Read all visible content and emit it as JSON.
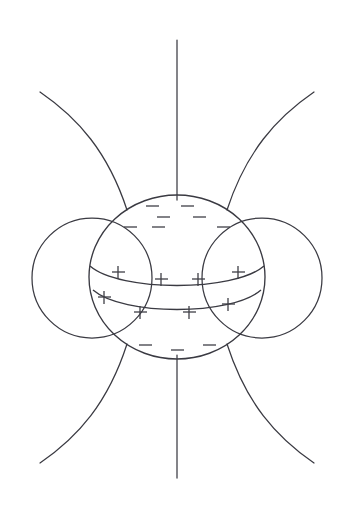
{
  "figure": {
    "background_color": "#ffffff",
    "line_color": "#3a3a42",
    "charge_color": "#3f3f46",
    "canvas": {
      "width": 354,
      "height": 517
    }
  },
  "sphere": {
    "name": "central-sphere",
    "center_x": 177,
    "center_y": 277,
    "radius_x": 88,
    "radius_y": 82,
    "top_y": 195,
    "bottom_y": 359,
    "left_x": 89,
    "right_x": 265
  },
  "equatorial_band": {
    "name": "positive-charge-band",
    "upper_curve_y": 268,
    "lower_curve_y": 292,
    "curve_sag": 24,
    "polarity": "positive"
  },
  "lobes": [
    {
      "name": "left-lobe",
      "center_x": 92,
      "center_y": 278,
      "radius": 60,
      "side": "left"
    },
    {
      "name": "right-lobe",
      "center_x": 262,
      "center_y": 278,
      "radius": 60,
      "side": "right"
    }
  ],
  "field_lines": {
    "vertical_top": {
      "name": "field-line-vertical-top",
      "x": 177,
      "y_start": 40,
      "y_end": 195
    },
    "vertical_bottom": {
      "name": "field-line-vertical-bottom",
      "x": 177,
      "y_start": 359,
      "y_end": 478
    },
    "diagonals": [
      {
        "name": "field-line-top-left",
        "quadrant": "top-left",
        "outer_x": 40,
        "outer_y": 92,
        "anchor_x": 127,
        "anchor_y": 210
      },
      {
        "name": "field-line-top-right",
        "quadrant": "top-right",
        "outer_x": 314,
        "outer_y": 92,
        "anchor_x": 227,
        "anchor_y": 210
      },
      {
        "name": "field-line-bottom-left",
        "quadrant": "bottom-left",
        "outer_x": 40,
        "outer_y": 463,
        "anchor_x": 127,
        "anchor_y": 344
      },
      {
        "name": "field-line-bottom-right",
        "quadrant": "bottom-right",
        "outer_x": 314,
        "outer_y": 463,
        "anchor_x": 227,
        "anchor_y": 344
      }
    ]
  },
  "charges": {
    "top_minus": {
      "symbol": "minus",
      "count": 7,
      "positions": [
        {
          "x": 152,
          "y": 206
        },
        {
          "x": 187,
          "y": 206
        },
        {
          "x": 163,
          "y": 217
        },
        {
          "x": 199,
          "y": 217
        },
        {
          "x": 130,
          "y": 227
        },
        {
          "x": 158,
          "y": 227
        },
        {
          "x": 223,
          "y": 227
        }
      ]
    },
    "band_plus": {
      "symbol": "plus",
      "count": 8,
      "positions": [
        {
          "x": 118,
          "y": 272
        },
        {
          "x": 161,
          "y": 279
        },
        {
          "x": 198,
          "y": 279
        },
        {
          "x": 238,
          "y": 272
        },
        {
          "x": 104,
          "y": 297
        },
        {
          "x": 140,
          "y": 312
        },
        {
          "x": 189,
          "y": 312
        },
        {
          "x": 228,
          "y": 304
        }
      ]
    },
    "bottom_minus": {
      "symbol": "minus",
      "count": 3,
      "positions": [
        {
          "x": 145,
          "y": 345
        },
        {
          "x": 177,
          "y": 350
        },
        {
          "x": 209,
          "y": 345
        }
      ]
    },
    "glyph_size": {
      "minus_width": 13,
      "plus_size": 13
    }
  }
}
